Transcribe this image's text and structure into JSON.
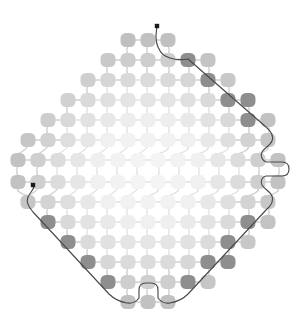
{
  "figure": {
    "title": "Lattice graph with traced boundary path",
    "type": "node-link-diagram",
    "width": 297,
    "height": 328,
    "background_color": "#ffffff",
    "layout": {
      "shape": "octagonal-diamond-lattice",
      "origin_x": 148.5,
      "origin_y": 172.0,
      "spacing_x": 20.0,
      "spacing_y": 20.0,
      "rows": 14,
      "max_columns": 14,
      "node_width": 15.0,
      "node_height": 14.0,
      "node_corner_radius": 5.5
    },
    "colors": {
      "node_center": "#f0f0f0",
      "node_mid": "#dcdcdc",
      "node_ring": "#cdcdcd",
      "node_outer": "#c0c0c0",
      "node_dark": "#8e8e8e",
      "link": "#e2e2e2",
      "link_outer": "#cfcfcf",
      "trace": "#4a4a4a",
      "endpoint": "#1a1a1a"
    },
    "link_width": 1.4,
    "trace_width": 1.15,
    "endpoint_radius": 2.2
  },
  "chart_data": {
    "type": "scatter",
    "title": "Lattice graph with traced boundary path",
    "xlabel": "",
    "ylabel": "",
    "grid": false,
    "legend": null,
    "rows": [
      {
        "y": 40,
        "x_start": 128,
        "count": 3,
        "shade": "outer"
      },
      {
        "y": 60,
        "x_start": 108,
        "count": 6,
        "shade": "outer"
      },
      {
        "y": 80,
        "x_start": 88,
        "count": 8,
        "shade": "outer"
      },
      {
        "y": 100,
        "x_start": 68,
        "count": 10,
        "shade": "outer"
      },
      {
        "y": 120,
        "x_start": 48,
        "count": 12,
        "shade": "ring"
      },
      {
        "y": 140,
        "x_start": 28,
        "count": 13,
        "shade": "ring"
      },
      {
        "y": 160,
        "x_start": 18,
        "count": 14,
        "shade": "mid"
      },
      {
        "y": 182,
        "x_start": 18,
        "count": 14,
        "shade": "mid"
      },
      {
        "y": 202,
        "x_start": 28,
        "count": 13,
        "shade": "ring"
      },
      {
        "y": 222,
        "x_start": 48,
        "count": 12,
        "shade": "ring"
      },
      {
        "y": 242,
        "x_start": 68,
        "count": 10,
        "shade": "outer"
      },
      {
        "y": 262,
        "x_start": 88,
        "count": 8,
        "shade": "outer"
      },
      {
        "y": 282,
        "x_start": 108,
        "count": 6,
        "shade": "outer"
      },
      {
        "y": 302,
        "x_start": 128,
        "count": 3,
        "shade": "outer"
      }
    ],
    "dark_nodes": [
      {
        "x": 190,
        "y": 60
      },
      {
        "x": 208,
        "y": 72
      },
      {
        "x": 216,
        "y": 82
      },
      {
        "x": 228,
        "y": 92
      },
      {
        "x": 238,
        "y": 104
      },
      {
        "x": 248,
        "y": 116
      },
      {
        "x": 258,
        "y": 128
      },
      {
        "x": 246,
        "y": 218
      },
      {
        "x": 240,
        "y": 232
      },
      {
        "x": 230,
        "y": 244
      },
      {
        "x": 218,
        "y": 256
      },
      {
        "x": 206,
        "y": 268
      },
      {
        "x": 196,
        "y": 282
      },
      {
        "x": 186,
        "y": 294
      },
      {
        "x": 50,
        "y": 222
      },
      {
        "x": 60,
        "y": 234
      },
      {
        "x": 70,
        "y": 246
      },
      {
        "x": 80,
        "y": 258
      },
      {
        "x": 92,
        "y": 270
      },
      {
        "x": 104,
        "y": 282
      },
      {
        "x": 114,
        "y": 294
      }
    ],
    "trace_endpoints": [
      {
        "x": 157,
        "y": 26,
        "label": "path-start-top"
      },
      {
        "x": 33,
        "y": 185,
        "label": "path-start-left"
      }
    ],
    "trace_path": "M157,26 C156,34 155,40 158,47 C161,54 164,56 170,58 C176,60 182,60 188,59 L266,127 C272,132 274,136 272,141 C270,146 264,148 262,152 C260,156 262,160 266,162 L282,162 C287,162 289,165 289,169 C289,174 286,176 282,176 L266,176 C262,177 260,181 262,185 C264,189 270,191 272,196 C274,201 272,205 266,210 L188,294 C182,300 176,302 170,303 C164,304 161,302 158,298 L158,290 C158,285 155,283 151,283 L146,283 C142,283 139,285 139,290 L139,298 C136,302 133,304 127,303 C121,302 115,300 109,294 L33,212 C28,206 26,202 28,197 C30,192 34,190 34,186 L33,185"
  },
  "accessibility": {
    "alt_text": "Octagonal lattice of rounded square nodes connected by thin links, with a dark traced path outlining the lattice boundary"
  }
}
